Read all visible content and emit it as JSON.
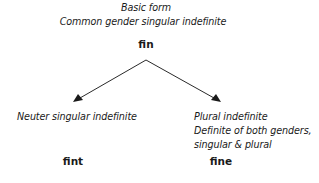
{
  "root": {
    "caption_line1": "Basic form",
    "caption_line2": "Common gender singular indefinite",
    "word": "fin"
  },
  "branches": [
    {
      "caption_lines": [
        "Neuter singular indefinite"
      ],
      "word": "fint"
    },
    {
      "caption_lines": [
        "Plural indefinite",
        "Definite of both genders,",
        "singular & plural"
      ],
      "word": "fine"
    }
  ],
  "colors": {
    "text": "#1a1a1a",
    "lines": "#2a2a2a"
  }
}
